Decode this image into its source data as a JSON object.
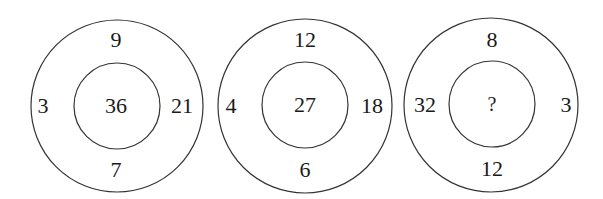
{
  "puzzle": {
    "type": "number-circle-puzzle",
    "circles": [
      {
        "top": "9",
        "left": "3",
        "right": "21",
        "bottom": "7",
        "center": "36"
      },
      {
        "top": "12",
        "left": "4",
        "right": "18",
        "bottom": "6",
        "center": "27"
      },
      {
        "top": "8",
        "left": "32",
        "right": "3",
        "bottom": "12",
        "center": "?"
      }
    ],
    "colors": {
      "stroke": "#333333",
      "text": "#1a1a1a",
      "background": "#ffffff"
    }
  }
}
